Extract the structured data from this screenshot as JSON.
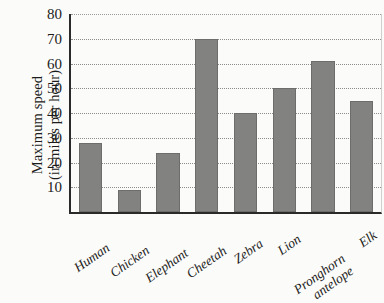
{
  "chart_data": {
    "type": "bar",
    "title": "",
    "subtitle": "",
    "xlabel": "",
    "ylabel": "Maximum speed (in miles per hour)",
    "ylabel_lines": [
      "Maximum speed",
      "(in miles per hour)"
    ],
    "categories": [
      "Human",
      "Chicken",
      "Elephant",
      "Cheetah",
      "Zebra",
      "Lion",
      "Pronghorn antelope",
      "Elk"
    ],
    "category_lines": [
      [
        "Human"
      ],
      [
        "Chicken"
      ],
      [
        "Elephant"
      ],
      [
        "Cheetah"
      ],
      [
        "Zebra"
      ],
      [
        "Lion"
      ],
      [
        "Pronghorn",
        "antelope"
      ],
      [
        "Elk"
      ]
    ],
    "values": [
      28,
      9,
      24,
      70,
      40,
      50,
      61,
      45
    ],
    "ylim": [
      0,
      80
    ],
    "ytick_labels": [
      "10",
      "20",
      "30",
      "40",
      "50",
      "60",
      "70",
      "80"
    ],
    "ytick_values": [
      10,
      20,
      30,
      40,
      50,
      60,
      70,
      80
    ],
    "grid": true,
    "grid_style": "dotted-horizontal",
    "legend": false,
    "legend_position": "none",
    "bar_color": "#828280",
    "bar_edge_color": "#6d6d6b",
    "axis_color": "#2a2a2a",
    "grid_color": "#8d8d88",
    "background_color": "#fbfbf9"
  }
}
